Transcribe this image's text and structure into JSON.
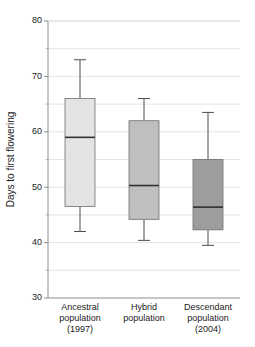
{
  "chart_data": {
    "type": "box",
    "title": "",
    "xlabel": "",
    "ylabel": "Days to first flowering",
    "ylim": [
      30,
      80
    ],
    "ytick_values": [
      30,
      40,
      50,
      60,
      70,
      80
    ],
    "ytick_labels": [
      "30",
      "40",
      "50",
      "60",
      "70",
      "80"
    ],
    "yminor_step": 5,
    "grid": true,
    "legend": "none",
    "categories": [
      "Ancestral population (1997)",
      "Hybrid population",
      "Descendant population (2004)"
    ],
    "category_lines": [
      [
        "Ancestral",
        "population",
        "(1997)"
      ],
      [
        "Hybrid",
        "population"
      ],
      [
        "Descendant",
        "population",
        "(2004)"
      ]
    ],
    "boxes": [
      {
        "name": "Ancestral population (1997)",
        "whisker_low": 42.0,
        "q1": 46.5,
        "median": 59.0,
        "q3": 66.0,
        "whisker_high": 73.0,
        "fill": "#e3e3e3"
      },
      {
        "name": "Hybrid population",
        "whisker_low": 40.4,
        "q1": 44.2,
        "median": 50.3,
        "q3": 62.0,
        "whisker_high": 66.0,
        "fill": "#bfbfbf"
      },
      {
        "name": "Descendant population (2004)",
        "whisker_low": 39.5,
        "q1": 42.3,
        "median": 46.4,
        "q3": 55.0,
        "whisker_high": 63.5,
        "fill": "#9d9d9d"
      }
    ]
  },
  "colors": {
    "axis": "#8c8c8c",
    "grid": "#dcdcdc",
    "median": "#303030",
    "whisker": "#4d4d4d",
    "text": "#1a1a1a"
  }
}
